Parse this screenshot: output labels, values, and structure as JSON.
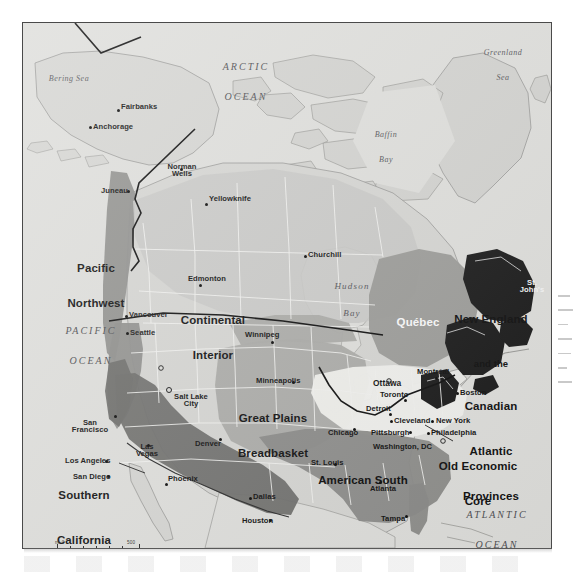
{
  "map": {
    "title": "Economic Regions of North America",
    "colors": {
      "background": "#d9d9d6",
      "land_light": "#d5d5d2",
      "pacific_northwest": "#8e8e8c",
      "southern_california_southwest": "#6e6e6c",
      "continental_interior": "#c2c2bf",
      "great_plains": "#a9a9a6",
      "old_economic_core": "#efefec",
      "american_south": "#8a8a88",
      "quebec": "#9a9a97",
      "new_england_atlantic": "#1b1b1b",
      "ocean": "#dededb",
      "border": "#111111",
      "state_line": "#f2f2ef"
    },
    "regions": [
      {
        "name": "Pacific Northwest",
        "lines": [
          "Pacific",
          "Northwest"
        ]
      },
      {
        "name": "Continental Interior",
        "lines": [
          "Continental",
          "Interior"
        ]
      },
      {
        "name": "Great Plains Breadbasket",
        "lines": [
          "Great Plains",
          "Breadbasket"
        ]
      },
      {
        "name": "Southern California and the Southwest",
        "lines": [
          "Southern",
          "California",
          "and the",
          "Southwest"
        ]
      },
      {
        "name": "American South",
        "lines": [
          "American South"
        ]
      },
      {
        "name": "Old Economic Core",
        "lines": [
          "Old Economic",
          "Core"
        ]
      },
      {
        "name": "Quebec",
        "lines": [
          "Québec"
        ]
      },
      {
        "name": "New England and the Canadian Atlantic Provinces",
        "lines": [
          "New England",
          "and the",
          "Canadian",
          "Atlantic",
          "Provinces"
        ]
      }
    ],
    "water_labels": [
      {
        "name": "Arctic Ocean",
        "lines": [
          "ARCTIC",
          "OCEAN"
        ],
        "style": "ocean"
      },
      {
        "name": "Pacific Ocean",
        "lines": [
          "PACIFIC",
          "OCEAN"
        ],
        "style": "ocean"
      },
      {
        "name": "Atlantic Ocean",
        "lines": [
          "ATLANTIC",
          "OCEAN"
        ],
        "style": "ocean"
      },
      {
        "name": "Bering Sea",
        "lines": [
          "Bering Sea"
        ],
        "style": "sea"
      },
      {
        "name": "Greenland Sea",
        "lines": [
          "Greenland",
          "Sea"
        ],
        "style": "sea"
      },
      {
        "name": "Baffin Bay",
        "lines": [
          "Baffin",
          "Bay"
        ],
        "style": "sea"
      },
      {
        "name": "Hudson Bay",
        "lines": [
          "Hudson",
          "Bay"
        ],
        "style": "sea"
      }
    ],
    "cities": [
      "Fairbanks",
      "Anchorage",
      "Juneau",
      "Norman Wells",
      "Yellowknife",
      "Churchill",
      "Edmonton",
      "Vancouver",
      "Seattle",
      "Winnipeg",
      "Salt Lake City",
      "Minneapolis",
      "San Francisco",
      "Las Vegas",
      "Denver",
      "Los Angeles",
      "San Diego",
      "Phoenix",
      "Chicago",
      "St. Louis",
      "Detroit",
      "Toronto",
      "Ottawa",
      "Montréal",
      "Cleveland",
      "Pittsburgh",
      "Washington, DC",
      "New York",
      "Philadelphia",
      "Boston",
      "St. John's",
      "Dallas",
      "Houston",
      "Atlanta",
      "Tampa"
    ],
    "scale": {
      "miles_label": "mi 0",
      "miles_max": "500",
      "km_label": "km 0",
      "km_max": "800"
    }
  }
}
